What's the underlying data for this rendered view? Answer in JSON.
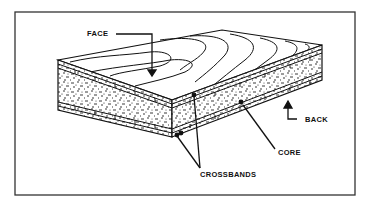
{
  "diagram": {
    "type": "plywood-cross-section",
    "labels": {
      "face": "FACE",
      "back": "BACK",
      "core": "CORE",
      "crossbands": "CROSSBANDS"
    },
    "colors": {
      "ink": "#111111",
      "paper": "#ffffff",
      "frame": "#333333"
    }
  }
}
